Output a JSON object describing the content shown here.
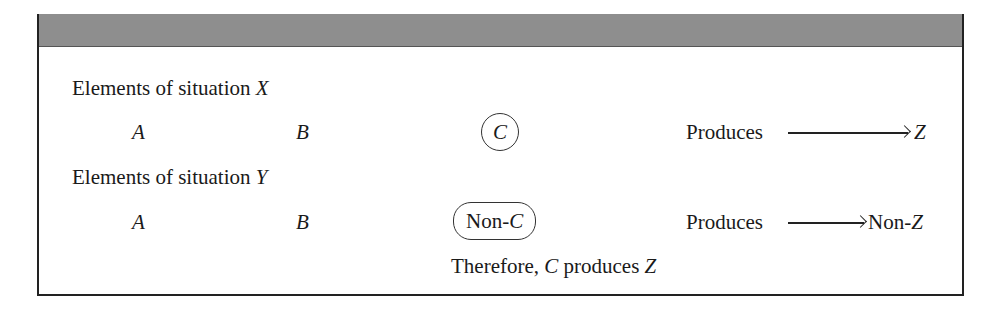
{
  "diagram": {
    "situation_x": {
      "label_prefix": "Elements of situation ",
      "label_var": "X",
      "elements": [
        "A",
        "B",
        "C"
      ],
      "circled_element": "C",
      "produces_label": "Produces",
      "result": "Z"
    },
    "situation_y": {
      "label_prefix": "Elements of situation ",
      "label_var": "Y",
      "elements": [
        "A",
        "B"
      ],
      "circled_prefix": "Non-",
      "circled_var": "C",
      "produces_label": "Produces",
      "result_prefix": "Non-",
      "result_var": "Z"
    },
    "conclusion": {
      "prefix": "Therefore, ",
      "var1": "C",
      "middle": " produces ",
      "var2": "Z"
    }
  }
}
